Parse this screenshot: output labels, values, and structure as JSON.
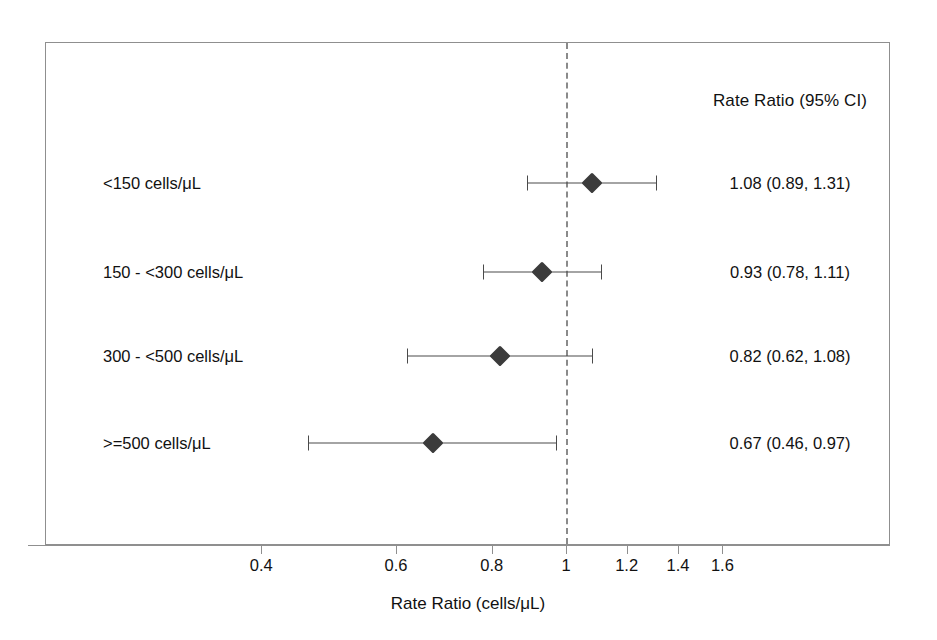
{
  "chart_data": {
    "type": "forest",
    "title": "",
    "xlabel": "Rate Ratio (cells/μL)",
    "ylabel": "",
    "xscale": "log",
    "xlim": [
      0.36,
      1.85
    ],
    "grid": false,
    "reference_line": 1,
    "estimate_column_header": "Rate Ratio (95% CI)",
    "xticks": [
      0.4,
      0.6,
      0.8,
      1,
      1.2,
      1.4,
      1.6
    ],
    "xticklabels": [
      "0.4",
      "0.6",
      "0.8",
      "1",
      "1.2",
      "1.4",
      "1.6"
    ],
    "categories": [
      "<150 cells/μL",
      "150 - <300 cells/μL",
      "300 - <500 cells/μL",
      ">=500 cells/μL"
    ],
    "estimates": [
      1.08,
      0.93,
      0.82,
      0.67
    ],
    "ci_low": [
      0.89,
      0.78,
      0.62,
      0.46
    ],
    "ci_high": [
      1.31,
      1.11,
      1.08,
      0.97
    ],
    "rows": [
      {
        "label": "<150 cells/μL",
        "estimate": 1.08,
        "ci_low": 0.89,
        "ci_high": 1.31,
        "estimate_text": "1.08 (0.89, 1.31)"
      },
      {
        "label": "150 - <300 cells/μL",
        "estimate": 0.93,
        "ci_low": 0.78,
        "ci_high": 1.11,
        "estimate_text": "0.93 (0.78, 1.11)"
      },
      {
        "label": "300 - <500 cells/μL",
        "estimate": 0.82,
        "ci_low": 0.62,
        "ci_high": 1.08,
        "estimate_text": "0.82 (0.62, 1.08)"
      },
      {
        "label": ">=500 cells/μL",
        "estimate": 0.67,
        "ci_low": 0.46,
        "ci_high": 0.97,
        "estimate_text": "0.67 (0.46, 0.97)"
      }
    ],
    "colors": {
      "marker": "#3b3b3b",
      "whisker": "#4a4a4a",
      "frame": "#8f8f8f",
      "reference_line": "#8a8a8a",
      "text": "#111111",
      "background": "#ffffff"
    }
  },
  "layout": {
    "label_column_x": 103,
    "estimate_column_center_x": 790,
    "row_y": [
      183,
      272,
      356,
      443
    ],
    "header_y": 101
  }
}
